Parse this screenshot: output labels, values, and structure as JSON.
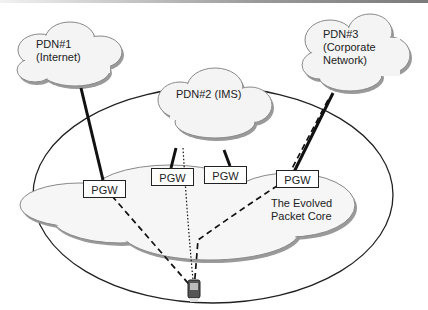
{
  "clouds": {
    "pdn1": {
      "line1": "PDN#1",
      "line2": "(Internet)"
    },
    "pdn2": {
      "line1": "PDN#2 (IMS)"
    },
    "pdn3": {
      "line1": "PDN#3",
      "line2": "(Corporate",
      "line3": "Network)"
    },
    "epc": {
      "line1": "The Evolved",
      "line2": "Packet Core"
    }
  },
  "gateways": [
    {
      "label": "PGW"
    },
    {
      "label": "PGW"
    },
    {
      "label": "PGW"
    },
    {
      "label": "PGW"
    }
  ],
  "colors": {
    "cloud_fill": "#f4f4f4",
    "cloud_stroke": "#888888",
    "shadow": "#9a9a9a",
    "line": "#111111"
  }
}
